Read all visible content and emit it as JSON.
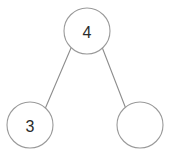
{
  "figure": {
    "background_color": "#ffffff",
    "node_fill": "#ffffff",
    "node_stroke": "#9a9a9a",
    "edge_color": "#8d8d8d",
    "label_color": "#2b2b2b"
  },
  "chart_data": {
    "type": "diagram",
    "diagram_type": "binary-tree",
    "title": "",
    "nodes": [
      {
        "id": "root",
        "label": "4",
        "cx": 87,
        "cy": 31,
        "r": 23,
        "role": "root"
      },
      {
        "id": "left",
        "label": "3",
        "cx": 30,
        "cy": 125,
        "r": 23,
        "role": "left-child"
      },
      {
        "id": "right",
        "label": "",
        "cx": 140,
        "cy": 125,
        "r": 23,
        "role": "right-child"
      }
    ],
    "edges": [
      {
        "from": "root",
        "to": "left",
        "x1": 71,
        "y1": 48,
        "x2": 45,
        "y2": 109
      },
      {
        "from": "root",
        "to": "right",
        "x1": 102,
        "y1": 47,
        "x2": 126,
        "y2": 109
      }
    ]
  }
}
